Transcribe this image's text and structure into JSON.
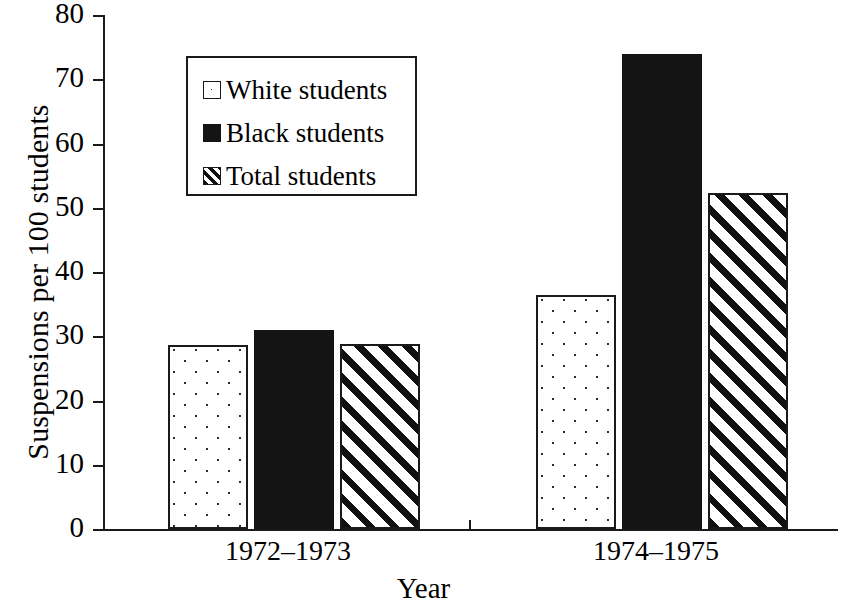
{
  "chart_data": {
    "type": "bar",
    "title": "",
    "xlabel": "Year",
    "ylabel": "Suspensions per 100 students",
    "categories": [
      "1972–1973",
      "1974–1975"
    ],
    "series": [
      {
        "name": "White students",
        "values": [
          28.7,
          36.5
        ],
        "fill": "dotted",
        "color": "#ffffff"
      },
      {
        "name": "Black students",
        "values": [
          31.0,
          74.0
        ],
        "fill": "solid",
        "color": "#141414"
      },
      {
        "name": "Total students",
        "values": [
          28.8,
          52.3
        ],
        "fill": "diagonal-hatch",
        "color": "#ffffff"
      }
    ],
    "ylim": [
      0,
      80
    ],
    "ytick_step": 10,
    "ytick_labels": [
      "80",
      "70",
      "60",
      "50",
      "40",
      "30",
      "20",
      "10",
      "0"
    ],
    "ytick_values": [
      80,
      70,
      60,
      50,
      40,
      30,
      20,
      10,
      0
    ],
    "grid": false,
    "legend_position": "upper-left-inside",
    "axis_color": "#1a1a1a"
  },
  "legend": {
    "items": [
      {
        "label": "White students",
        "style": "white-style"
      },
      {
        "label": "Black students",
        "style": "black-style"
      },
      {
        "label": "Total students",
        "style": "hatch-style"
      }
    ]
  }
}
